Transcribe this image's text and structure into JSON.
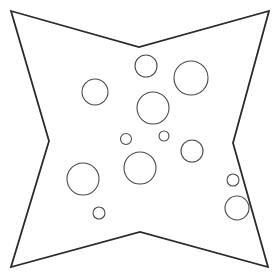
{
  "figure": {
    "canvas": {
      "width": 280,
      "height": 279,
      "background": "#ffffff"
    },
    "star": {
      "name": "four-pointed-star",
      "stroke": "#2b2b2b",
      "stroke_width": 1.8,
      "fill": "#ffffff",
      "points": "11,11 139,47 269,11 233,143 268,267 140,232 11,267 49,141"
    },
    "circles": [
      {
        "name": "circle-top-center",
        "cx": 146,
        "cy": 66,
        "r": 11,
        "stroke": "#4a4a4a",
        "stroke_width": 1.1
      },
      {
        "name": "circle-top-right-large",
        "cx": 191,
        "cy": 78,
        "r": 17,
        "stroke": "#4a4a4a",
        "stroke_width": 1.1
      },
      {
        "name": "circle-upper-left",
        "cx": 95,
        "cy": 92,
        "r": 13,
        "stroke": "#4a4a4a",
        "stroke_width": 1.1
      },
      {
        "name": "circle-center-large",
        "cx": 153,
        "cy": 108,
        "r": 16,
        "stroke": "#4a4a4a",
        "stroke_width": 1.1
      },
      {
        "name": "circle-mid-small-left",
        "cx": 126,
        "cy": 139,
        "r": 5.5,
        "stroke": "#4a4a4a",
        "stroke_width": 1.1
      },
      {
        "name": "circle-mid-small-right",
        "cx": 164,
        "cy": 136,
        "r": 5,
        "stroke": "#4a4a4a",
        "stroke_width": 1.1
      },
      {
        "name": "circle-mid-right",
        "cx": 192,
        "cy": 151,
        "r": 11,
        "stroke": "#4a4a4a",
        "stroke_width": 1.1
      },
      {
        "name": "circle-lower-center-large",
        "cx": 140,
        "cy": 168,
        "r": 16,
        "stroke": "#4a4a4a",
        "stroke_width": 1.1
      },
      {
        "name": "circle-lower-left-large",
        "cx": 83,
        "cy": 179,
        "r": 16,
        "stroke": "#4a4a4a",
        "stroke_width": 1.1
      },
      {
        "name": "circle-bottom-small",
        "cx": 99,
        "cy": 213,
        "r": 6,
        "stroke": "#4a4a4a",
        "stroke_width": 1.1
      },
      {
        "name": "circle-right-edge-small",
        "cx": 233,
        "cy": 180,
        "r": 6,
        "stroke": "#4a4a4a",
        "stroke_width": 1.1
      },
      {
        "name": "circle-right-edge-large",
        "cx": 237,
        "cy": 208,
        "r": 12,
        "stroke": "#4a4a4a",
        "stroke_width": 1.1
      }
    ]
  }
}
